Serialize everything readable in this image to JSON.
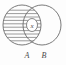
{
  "figure": {
    "name": "venn-diagram-two-sets",
    "background_color": "#fdfdfd",
    "width": 66,
    "height": 65,
    "stroke_color": "#6b6b6b",
    "text_color": "#4a4a4a"
  },
  "sets": {
    "left": {
      "label": "A",
      "label_x": 27,
      "label_y": 58,
      "center_x": 22,
      "center_y": 25,
      "radius_x": 19,
      "radius_y": 20,
      "shaded": true,
      "shading_style": "horizontal-hatch"
    },
    "right": {
      "label": "B",
      "label_x": 44,
      "label_y": 58,
      "center_x": 42,
      "center_y": 25,
      "radius_x": 19,
      "radius_y": 20,
      "shaded": false,
      "shading_style": "none"
    }
  },
  "marker": {
    "label": "x",
    "center_x": 32,
    "center_y": 25,
    "radius_x": 5.5,
    "radius_y": 6.5
  },
  "hatching": {
    "line_color": "#7a7a7a",
    "line_width": 0.75,
    "spacing": 3.4,
    "y_values": [
      10.2,
      13.6,
      17.0,
      20.4,
      23.8,
      27.2,
      30.6,
      34.0,
      37.4,
      40.8
    ]
  }
}
